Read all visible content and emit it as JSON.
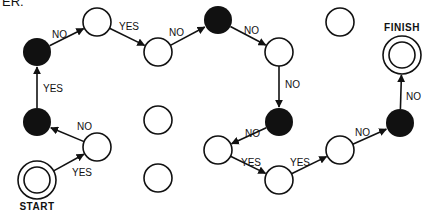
{
  "header": {
    "partial_text": "ER."
  },
  "colors": {
    "ink": "#111111",
    "background": "#ffffff"
  },
  "nodes": [
    {
      "id": "A",
      "type": "filled",
      "x": 37,
      "y": 52
    },
    {
      "id": "B",
      "type": "hollow",
      "x": 97,
      "y": 22
    },
    {
      "id": "C",
      "type": "hollow",
      "x": 158,
      "y": 52
    },
    {
      "id": "D",
      "type": "filled",
      "x": 218,
      "y": 20
    },
    {
      "id": "E",
      "type": "hollow",
      "x": 279,
      "y": 52
    },
    {
      "id": "F",
      "type": "hollow",
      "x": 340,
      "y": 22
    },
    {
      "id": "FINISH",
      "type": "double",
      "x": 402,
      "y": 55,
      "label": "FINISH"
    },
    {
      "id": "G",
      "type": "filled",
      "x": 37,
      "y": 122
    },
    {
      "id": "H",
      "type": "hollow",
      "x": 97,
      "y": 147
    },
    {
      "id": "START",
      "type": "double",
      "x": 37,
      "y": 180,
      "label": "START"
    },
    {
      "id": "I",
      "type": "hollow",
      "x": 158,
      "y": 120
    },
    {
      "id": "J",
      "type": "hollow",
      "x": 158,
      "y": 178
    },
    {
      "id": "K",
      "type": "filled",
      "x": 279,
      "y": 122
    },
    {
      "id": "L",
      "type": "hollow",
      "x": 218,
      "y": 150
    },
    {
      "id": "M",
      "type": "hollow",
      "x": 279,
      "y": 180
    },
    {
      "id": "N",
      "type": "hollow",
      "x": 340,
      "y": 150
    },
    {
      "id": "O",
      "type": "filled",
      "x": 400,
      "y": 123
    }
  ],
  "edges": [
    {
      "from": "START",
      "to": "H",
      "label": "YES",
      "lx": 72,
      "ly": 176
    },
    {
      "from": "H",
      "to": "G",
      "label": "NO",
      "lx": 77,
      "ly": 130
    },
    {
      "from": "G",
      "to": "A",
      "label": "YES",
      "lx": 43,
      "ly": 92
    },
    {
      "from": "A",
      "to": "B",
      "label": "NO",
      "lx": 52,
      "ly": 38
    },
    {
      "from": "B",
      "to": "C",
      "label": "YES",
      "lx": 119,
      "ly": 30
    },
    {
      "from": "C",
      "to": "D",
      "label": "NO",
      "lx": 169,
      "ly": 36
    },
    {
      "from": "D",
      "to": "E",
      "label": "NO",
      "lx": 244,
      "ly": 34
    },
    {
      "from": "E",
      "to": "K",
      "label": "NO",
      "lx": 285,
      "ly": 88
    },
    {
      "from": "K",
      "to": "L",
      "label": "NO",
      "lx": 245,
      "ly": 137
    },
    {
      "from": "L",
      "to": "M",
      "label": "YES",
      "lx": 241,
      "ly": 166
    },
    {
      "from": "M",
      "to": "N",
      "label": "YES",
      "lx": 290,
      "ly": 166
    },
    {
      "from": "N",
      "to": "O",
      "label": "NO",
      "lx": 355,
      "ly": 136
    },
    {
      "from": "O",
      "to": "FINISH",
      "label": "NO",
      "lx": 406,
      "ly": 100
    }
  ]
}
